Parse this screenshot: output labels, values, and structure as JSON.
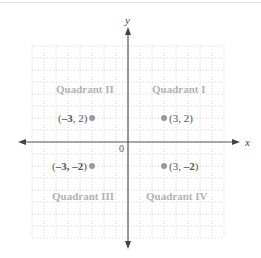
{
  "diagram": {
    "type": "cartesian-plane",
    "axes": {
      "x_label": "x",
      "y_label": "y",
      "origin_label": "0"
    },
    "grid": {
      "x_min": -8,
      "x_max": 8,
      "y_min": -8,
      "y_max": 8,
      "step": 1
    },
    "quadrants": [
      {
        "id": "I",
        "label": "Quadrant I"
      },
      {
        "id": "II",
        "label": "Quadrant II"
      },
      {
        "id": "III",
        "label": "Quadrant III"
      },
      {
        "id": "IV",
        "label": "Quadrant IV"
      }
    ],
    "points": [
      {
        "x": -3,
        "y": 2,
        "label_pre": "(",
        "label_bold": "–3",
        "label_post": ", 2)"
      },
      {
        "x": 3,
        "y": 2,
        "label": "(3, 2)"
      },
      {
        "x": -3,
        "y": -2,
        "label_pre": "(",
        "label_bold": "–3, –2",
        "label_post": ")"
      },
      {
        "x": 3,
        "y": -2,
        "label_pre": "(3, ",
        "label_bold": "–2",
        "label_post": ")"
      }
    ],
    "colors": {
      "axis": "#555555",
      "grid": "#c8c8c8",
      "point": "#999999",
      "quadrant_label": "#b3b3b3",
      "point_label": "#555555"
    }
  }
}
